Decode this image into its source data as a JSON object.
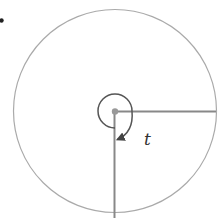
{
  "diagram": {
    "angle_label": "t",
    "geometry": {
      "center": [
        115,
        111
      ],
      "outer_radius": 101,
      "inner_radius": 17,
      "radius_rays": [
        "east",
        "south"
      ]
    },
    "colors": {
      "outer_circle": "#aaaaaa",
      "radius_lines": "#888888",
      "spiral_arc": "#555555",
      "center_dot": "#999999",
      "bullet": "#222222",
      "label": "#333333"
    }
  }
}
